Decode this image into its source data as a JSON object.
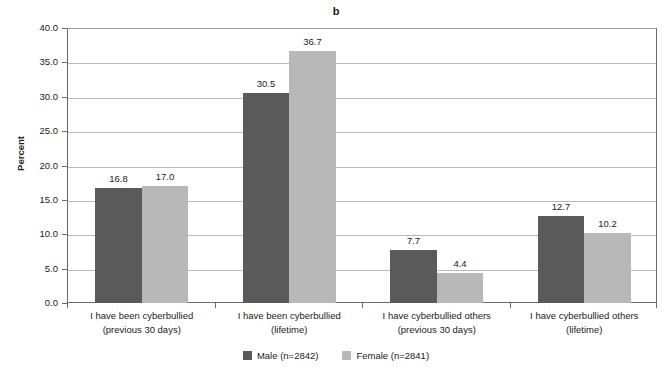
{
  "chart_data": {
    "type": "bar",
    "title": "b",
    "xlabel": "",
    "ylabel": "Percent",
    "ylim": [
      0,
      40
    ],
    "ytick_labels": [
      "0.0",
      "5.0",
      "10.0",
      "15.0",
      "20.0",
      "25.0",
      "30.0",
      "35.0",
      "40.0"
    ],
    "ytick_values": [
      0,
      5,
      10,
      15,
      20,
      25,
      30,
      35,
      40
    ],
    "grid": true,
    "legend_position": "bottom-center",
    "categories": [
      "I have been cyberbullied (previous 30 days)",
      "I have been cyberbullied (lifetime)",
      "I have cyberbullied others (previous 30 days)",
      "I have cyberbullied others (lifetime)"
    ],
    "category_lines": [
      {
        "line1": "I have been cyberbullied",
        "line2": "(previous 30 days)"
      },
      {
        "line1": "I have been cyberbullied",
        "line2": "(lifetime)"
      },
      {
        "line1": "I have cyberbullied others",
        "line2": "(previous 30 days)"
      },
      {
        "line1": "I have cyberbullied others",
        "line2": "(lifetime)"
      }
    ],
    "series": [
      {
        "name": "Male (n=2842)",
        "color": "#5a5a5a",
        "values": [
          16.8,
          30.5,
          7.7,
          12.7
        ],
        "labels": [
          "16.8",
          "30.5",
          "7.7",
          "12.7"
        ]
      },
      {
        "name": "Female (n=2841)",
        "color": "#b8b8b8",
        "values": [
          17.0,
          36.7,
          4.4,
          10.2
        ],
        "labels": [
          "17.0",
          "36.7",
          "4.4",
          "10.2"
        ]
      }
    ]
  },
  "legend": {
    "items": [
      {
        "label": "Male (n=2842)",
        "color": "#5a5a5a"
      },
      {
        "label": "Female (n=2841)",
        "color": "#b8b8b8"
      }
    ]
  },
  "colors": {
    "male": "#5a5a5a",
    "female": "#b8b8b8",
    "gridline": "#b9b9b9",
    "axis": "#6a6a6a",
    "text": "#1a1a1a",
    "background": "#ffffff"
  }
}
